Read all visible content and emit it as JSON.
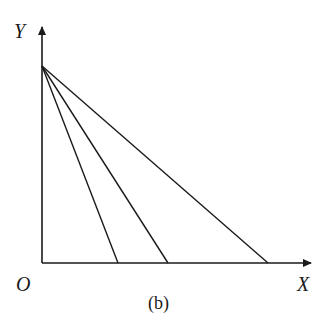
{
  "figure": {
    "caption": "(b)",
    "y_label": "Y",
    "x_label": "X",
    "origin_label": "O"
  },
  "lines": [
    {
      "name": "line-1",
      "y_intercept_px": 66,
      "x_intercept_px": 118
    },
    {
      "name": "line-2",
      "y_intercept_px": 66,
      "x_intercept_px": 168
    },
    {
      "name": "line-3",
      "y_intercept_px": 66,
      "x_intercept_px": 268
    }
  ],
  "colors": {
    "stroke": "#1a1a1a",
    "background": "#ffffff"
  }
}
